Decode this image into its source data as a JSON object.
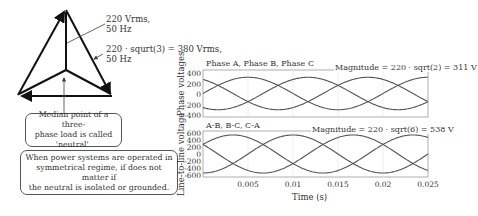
{
  "diagram": {
    "phase_label_line1": "220 Vrms,",
    "phase_label_line2": "50 Hz",
    "line_label_line1": "220 · squrt(3) = 380 Vrms,",
    "line_label_line2": "50 Hz",
    "callout_neutral": "Median point of a three-phase load is called 'neutral'.",
    "callout_neutral_lines": [
      "Median point of a three-",
      "phase load is called",
      "'neutral'."
    ],
    "callout_symmetric_lines": [
      "When power systems are operated in",
      "symmetrical regime, if does not matter if",
      "the neutral is isolated or grounded."
    ]
  },
  "chart_data": [
    {
      "type": "line",
      "title": "Phase A, Phase B, Phase C",
      "annotation": "Magnitude = 220 · sqrt(2) = 311 V",
      "ylabel": "Phase voltages",
      "xlabel": "",
      "xlim": [
        0,
        0.025
      ],
      "ylim": [
        -450,
        450
      ],
      "yticks": [
        "400",
        "200",
        "0",
        "-200",
        "-400"
      ],
      "grid": true,
      "series": [
        {
          "name": "Phase A",
          "amplitude": 311,
          "frequency_hz": 50,
          "phase_deg": 0
        },
        {
          "name": "Phase B",
          "amplitude": 311,
          "frequency_hz": 50,
          "phase_deg": -120
        },
        {
          "name": "Phase C",
          "amplitude": 311,
          "frequency_hz": 50,
          "phase_deg": 120
        }
      ]
    },
    {
      "type": "line",
      "title": "A-B, B-C, C-A",
      "annotation": "Magnitude = 220 · sqrt(6) = 538 V",
      "ylabel": "Line-to-line voltage",
      "xlabel": "Time (s)",
      "xlim": [
        0,
        0.025
      ],
      "ylim": [
        -650,
        650
      ],
      "yticks": [
        "600",
        "400",
        "200",
        "0",
        "-200",
        "-400",
        "-600"
      ],
      "xticks": [
        "0.005",
        "0.01",
        "0.015",
        "0.02",
        "0.025"
      ],
      "grid": true,
      "series": [
        {
          "name": "A-B",
          "amplitude": 538,
          "frequency_hz": 50,
          "phase_deg": 30
        },
        {
          "name": "B-C",
          "amplitude": 538,
          "frequency_hz": 50,
          "phase_deg": -90
        },
        {
          "name": "C-A",
          "amplitude": 538,
          "frequency_hz": 50,
          "phase_deg": 150
        }
      ]
    }
  ]
}
